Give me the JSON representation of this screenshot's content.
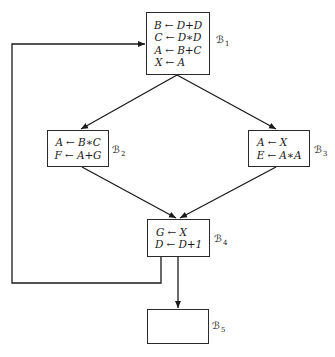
{
  "diagram": {
    "type": "control-flow-graph",
    "blocks": [
      {
        "id": "B1",
        "label": "ℬ",
        "sub": "1",
        "statements": [
          "B ← D+D",
          "C ← D∗D",
          "A ← B+C",
          "X ← A"
        ]
      },
      {
        "id": "B2",
        "label": "ℬ",
        "sub": "2",
        "statements": [
          "A ← B∗C",
          "F ← A+G"
        ]
      },
      {
        "id": "B3",
        "label": "ℬ",
        "sub": "3",
        "statements": [
          "A ← X",
          "E ← A∗A"
        ]
      },
      {
        "id": "B4",
        "label": "ℬ",
        "sub": "4",
        "statements": [
          "G ← X",
          "D ← D+1"
        ]
      },
      {
        "id": "B5",
        "label": "ℬ",
        "sub": "5",
        "statements": []
      }
    ],
    "edges": [
      {
        "from": "B1",
        "to": "B2"
      },
      {
        "from": "B1",
        "to": "B3"
      },
      {
        "from": "B2",
        "to": "B4"
      },
      {
        "from": "B3",
        "to": "B4"
      },
      {
        "from": "B4",
        "to": "B5"
      },
      {
        "from": "B4",
        "to": "B1",
        "kind": "back-edge"
      }
    ]
  }
}
